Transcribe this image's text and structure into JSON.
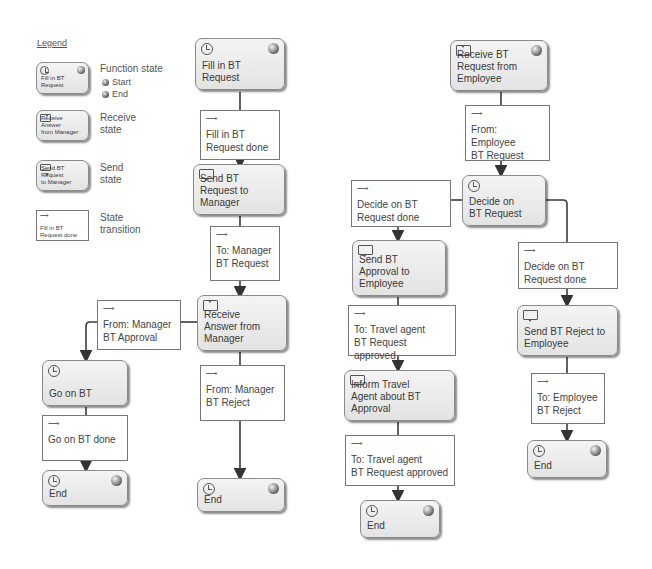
{
  "legend": {
    "title": "Legend",
    "function_state": {
      "label": "Function state",
      "sample": "Fill in BT\nRequest",
      "start": "Start",
      "end": "End"
    },
    "receive_state": {
      "label": "Receive\nstate",
      "sample": "Receive Answer\nfrom Manager"
    },
    "send_state": {
      "label": "Send\nstate",
      "sample": "Send BT Request\nto Manager"
    },
    "state_transition": {
      "label": "State\ntransition",
      "sample": "Fill in BT\nRequest done"
    }
  },
  "employee_flow": {
    "fill_in": {
      "label": "Fill in BT Request",
      "type": "function",
      "icons": [
        "clock-icon",
        "start-ball-icon"
      ]
    },
    "t_fill_done": {
      "label": "Fill in BT\nRequest done"
    },
    "send_request": {
      "label": "Send BT Request to Manager",
      "type": "send"
    },
    "t_to_manager": {
      "label": "To: Manager\nBT Request"
    },
    "receive_answer": {
      "label": "Receive Answer from Manager",
      "type": "receive"
    },
    "t_from_manager_approval": {
      "label": "From: Manager\nBT Approval"
    },
    "go_on": {
      "label": "Go on BT",
      "type": "function"
    },
    "t_go_on_done": {
      "label": "Go on BT done"
    },
    "end_left": {
      "label": "End",
      "type": "function-end"
    },
    "t_from_manager_reject": {
      "label": "From: Manager\nBT Reject"
    },
    "end_reject": {
      "label": "End",
      "type": "function-end"
    }
  },
  "manager_flow": {
    "receive_request": {
      "label": "Receive BT Request from Employee",
      "type": "receive"
    },
    "t_from_employee": {
      "label": "From: Employee\nBT Request"
    },
    "decide": {
      "label": "Decide on BT Request",
      "type": "function"
    },
    "t_decide_done_left": {
      "label": "Decide on BT\nRequest done"
    },
    "send_approval": {
      "label": "Send BT Approval to Employee",
      "type": "send"
    },
    "t_to_travel_agent_1": {
      "label": "To: Travel agent\nBT Request approved"
    },
    "inform_agent": {
      "label": "Inform Travel Agent about BT Approval",
      "type": "send"
    },
    "t_to_travel_agent_2": {
      "label": "To: Travel agent\nBT Request approved"
    },
    "end_approval": {
      "label": "End",
      "type": "function-end"
    },
    "t_decide_done_right": {
      "label": "Decide on BT\nRequest done"
    },
    "send_reject": {
      "label": "Send BT Reject to Employee",
      "type": "send"
    },
    "t_to_employee_reject": {
      "label": "To: Employee\nBT Reject"
    },
    "end_reject": {
      "label": "End",
      "type": "function-end"
    }
  },
  "colors": {
    "state_fill": "#ececec",
    "border": "#8a8a8a",
    "connector": "#3a3a3a",
    "transition_fill": "#ffffff"
  }
}
